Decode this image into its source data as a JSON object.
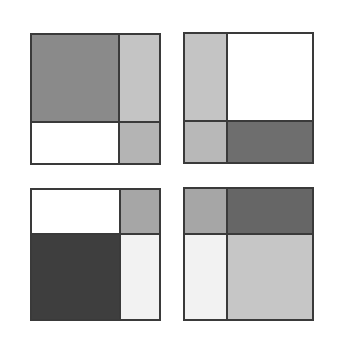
{
  "figure": {
    "colors": {
      "white": "#ffffff",
      "near_white": "#f2f2f2",
      "light_gray": "#c4c4c4",
      "mid_gray": "#a6a6a6",
      "dark_gray": "#7a7a7a",
      "darker_gray": "#6e6e6e",
      "very_dark": "#3e3e3e",
      "border": "#3a3a3a"
    },
    "panels": [
      {
        "id": "top-left",
        "box": {
          "x": 30,
          "y": 33,
          "w": 131,
          "h": 132
        },
        "split": {
          "vx": 87,
          "hy": 87
        },
        "cells": {
          "tl": "#8a8a8a",
          "tr": "#c4c4c4",
          "bl": "#ffffff",
          "br": "#b4b4b4"
        }
      },
      {
        "id": "top-right",
        "box": {
          "x": 183,
          "y": 32,
          "w": 131,
          "h": 132
        },
        "split": {
          "vx": 42,
          "hy": 87
        },
        "cells": {
          "tl": "#c4c4c4",
          "tr": "#ffffff",
          "bl": "#b8b8b8",
          "br": "#6e6e6e"
        }
      },
      {
        "id": "bottom-left",
        "box": {
          "x": 30,
          "y": 188,
          "w": 131,
          "h": 133
        },
        "split": {
          "vx": 88,
          "hy": 44
        },
        "cells": {
          "tl": "#ffffff",
          "tr": "#a6a6a6",
          "bl": "#3e3e3e",
          "br": "#f2f2f2"
        }
      },
      {
        "id": "bottom-right",
        "box": {
          "x": 183,
          "y": 187,
          "w": 131,
          "h": 134
        },
        "split": {
          "vx": 42,
          "hy": 45
        },
        "cells": {
          "tl": "#a6a6a6",
          "tr": "#666666",
          "bl": "#f2f2f2",
          "br": "#c6c6c6"
        }
      }
    ]
  }
}
